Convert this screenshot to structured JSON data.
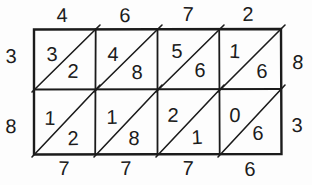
{
  "colors": {
    "ink": "#1b1b1b",
    "background": "#fdfdfd"
  },
  "lattice": {
    "top_digits": [
      "4",
      "6",
      "7",
      "2"
    ],
    "left_digits": [
      "3",
      "8"
    ],
    "right_digits": [
      "8",
      "3"
    ],
    "bottom_digits": [
      "7",
      "7",
      "7",
      "6"
    ],
    "cells": [
      [
        {
          "tens": "3",
          "units": "2"
        },
        {
          "tens": "4",
          "units": "8"
        },
        {
          "tens": "5",
          "units": "6"
        },
        {
          "tens": "1",
          "units": "6"
        }
      ],
      [
        {
          "tens": "1",
          "units": "2"
        },
        {
          "tens": "1",
          "units": "8"
        },
        {
          "tens": "2",
          "units": "1"
        },
        {
          "tens": "0",
          "units": "6"
        }
      ]
    ]
  }
}
